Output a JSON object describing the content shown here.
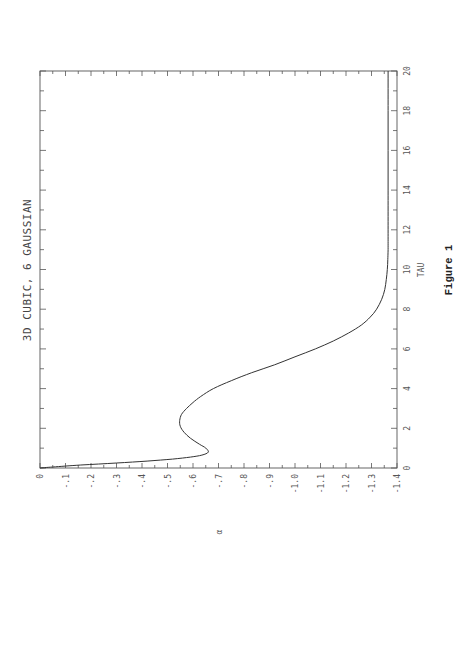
{
  "page": {
    "title": "3D CUBIC, 6 GAUSSIAN",
    "xlabel": "TAU",
    "ylabel": "α",
    "figure_caption": "Figure 1",
    "orientation": "rotated 90° counter-clockwise"
  },
  "chart_data": {
    "type": "line",
    "title": "3D CUBIC, 6 GAUSSIAN",
    "xlabel": "TAU",
    "ylabel": "α",
    "xlim": [
      0,
      20
    ],
    "ylim": [
      0,
      -1.4
    ],
    "x_ticks": [
      0,
      2,
      4,
      6,
      8,
      10,
      12,
      14,
      16,
      18,
      20
    ],
    "x_tick_labels": [
      "0",
      "2",
      "4",
      "6",
      "8",
      "10",
      "12",
      "14",
      "16",
      "18",
      "20"
    ],
    "y_ticks": [
      0,
      -0.1,
      -0.2,
      -0.3,
      -0.4,
      -0.5,
      -0.6,
      -0.7,
      -0.8,
      -0.9,
      -1.0,
      -1.1,
      -1.2,
      -1.3,
      -1.4
    ],
    "y_tick_labels": [
      "0",
      "-.1",
      "-.2",
      "-.3",
      "-.4",
      "-.5",
      "-.6",
      "-.7",
      "-.8",
      "-.9",
      "-1.0",
      "-1.1",
      "-1.2",
      "-1.3",
      "-1.4"
    ],
    "grid": false,
    "legend": null,
    "caption": "Figure 1",
    "series": [
      {
        "name": "α(TAU)",
        "x": [
          0,
          0.05,
          0.15,
          0.25,
          0.35,
          0.45,
          0.55,
          0.65,
          0.8,
          1.0,
          1.2,
          1.5,
          1.8,
          2.1,
          2.4,
          2.7,
          3.0,
          3.3,
          3.6,
          4.0,
          4.4,
          4.8,
          5.2,
          5.6,
          6.0,
          6.4,
          6.8,
          7.2,
          7.6,
          8.0,
          8.5,
          9.0,
          9.5,
          10.0,
          10.5,
          11,
          12,
          14,
          16,
          18,
          20
        ],
        "values": [
          0,
          -0.05,
          -0.16,
          -0.3,
          -0.42,
          -0.52,
          -0.59,
          -0.635,
          -0.66,
          -0.65,
          -0.625,
          -0.59,
          -0.565,
          -0.55,
          -0.548,
          -0.555,
          -0.575,
          -0.6,
          -0.63,
          -0.68,
          -0.75,
          -0.83,
          -0.92,
          -1.0,
          -1.08,
          -1.15,
          -1.21,
          -1.26,
          -1.295,
          -1.32,
          -1.34,
          -1.352,
          -1.358,
          -1.362,
          -1.364,
          -1.365,
          -1.365,
          -1.365,
          -1.365,
          -1.365,
          -1.365
        ]
      }
    ]
  }
}
